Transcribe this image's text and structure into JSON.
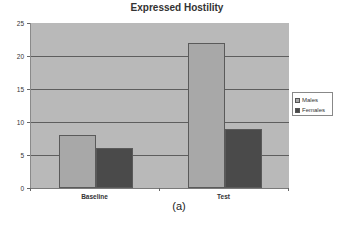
{
  "chart_data": {
    "type": "bar",
    "title": "Expressed Hostility",
    "categories": [
      "Baseline",
      "Test"
    ],
    "series": [
      {
        "name": "Males",
        "values": [
          8,
          22
        ],
        "color": "#a8a8a8"
      },
      {
        "name": "Females",
        "values": [
          6,
          9
        ],
        "color": "#4a4a4a"
      }
    ],
    "xlabel": "",
    "ylabel": "",
    "ylim": [
      0,
      25
    ],
    "yticks": [
      0,
      5,
      10,
      15,
      20,
      25
    ],
    "grid": true,
    "legend_position": "right",
    "plot_background": "#b9b9b9",
    "caption": "(a)"
  }
}
